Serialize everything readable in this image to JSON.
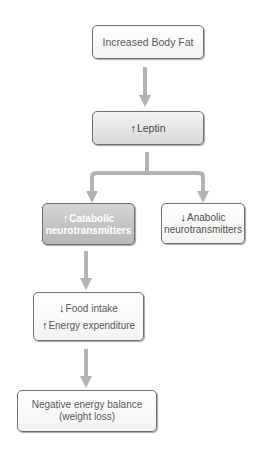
{
  "diagram": {
    "nodes": [
      {
        "id": "body_fat",
        "label": "Increased Body Fat",
        "arrow": ""
      },
      {
        "id": "leptin",
        "label": "Leptin",
        "arrow": "↑"
      },
      {
        "id": "catabolic",
        "line1": "Catabolic",
        "line2": "neurotransmitters",
        "arrow": "↑"
      },
      {
        "id": "anabolic",
        "line1": "Anabolic",
        "line2": "neurotransmitters",
        "arrow": "↓"
      },
      {
        "id": "food_energy",
        "line1": "Food intake",
        "line1_arrow": "↓",
        "line2": "Energy expenditure",
        "line2_arrow": "↑"
      },
      {
        "id": "negative_balance",
        "line1": "Negative energy balance",
        "line2": "(weight loss)"
      }
    ],
    "edges": [
      {
        "from": "body_fat",
        "to": "leptin"
      },
      {
        "from": "leptin",
        "to": "catabolic"
      },
      {
        "from": "leptin",
        "to": "anabolic"
      },
      {
        "from": "catabolic",
        "to": "food_energy"
      },
      {
        "from": "food_energy",
        "to": "negative_balance"
      }
    ],
    "colors": {
      "arrow": "#b3b3b3",
      "border": "#6f6f6f",
      "text": "#5a5a5a",
      "highlight_fill": "#c4c4c4"
    }
  }
}
